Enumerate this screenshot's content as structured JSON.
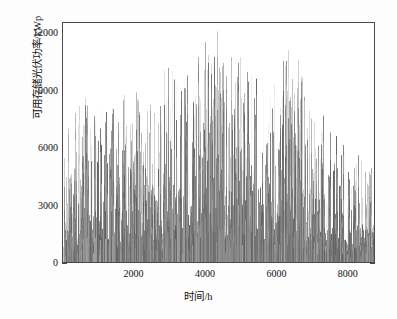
{
  "chart_data": {
    "type": "bar",
    "title": "",
    "subtitle": "",
    "xlabel": "时间/h",
    "ylabel": "可用存储光伏功率/kWp",
    "xlim": [
      0,
      8760
    ],
    "ylim": [
      0,
      12600
    ],
    "xticks": [
      2000,
      4000,
      6000,
      8000
    ],
    "xtick_labels": [
      "2000",
      "4000",
      "6000",
      "8000"
    ],
    "xticks_minor": [
      1000,
      3000,
      5000,
      7000
    ],
    "yticks": [
      0,
      3000,
      6000,
      9000,
      12000
    ],
    "ytick_labels": [
      "0",
      "3000",
      "6000",
      "9000",
      "12000"
    ],
    "yticks_minor": [
      1500,
      4500,
      7500,
      10500
    ],
    "grid": false,
    "legend": null,
    "legend_position": "none",
    "series": [
      {
        "name": "可用存储光伏功率",
        "color": "#808080",
        "line_width": 0.6,
        "n_points": 8760,
        "x_start": 0,
        "x_end": 8760,
        "x_step": 1,
        "units": "kWp",
        "description": "逐小时可用存储光伏功率，全年 8760 点，密集竖线柱状分布，夏季 (3500-6000 h) 峰值最高",
        "y_min": 0,
        "y_max": 12400,
        "y_mean": 2100,
        "peak_value": 12400,
        "peak_hour": 4210,
        "envelope_hours": [
          0,
          300,
          600,
          900,
          1200,
          1500,
          1800,
          2100,
          2400,
          2700,
          3000,
          3300,
          3600,
          3900,
          4200,
          4500,
          4800,
          5100,
          5400,
          5700,
          6000,
          6300,
          6600,
          6900,
          7200,
          7500,
          7800,
          8100,
          8400,
          8760
        ],
        "envelope_maxima": [
          6200,
          7800,
          8700,
          7600,
          8600,
          7900,
          9700,
          9100,
          9100,
          8700,
          11600,
          9000,
          10300,
          11200,
          12400,
          11900,
          10500,
          11000,
          9700,
          9500,
          9300,
          11200,
          11000,
          8000,
          7500,
          8000,
          6600,
          5400,
          5800,
          4900
        ]
      }
    ]
  },
  "axes": {
    "frame_color": "#4a4a4a",
    "background": "#ffffff",
    "tick_direction": "in-out"
  }
}
